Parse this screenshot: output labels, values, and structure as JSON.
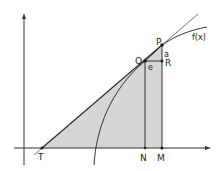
{
  "diagram": {
    "labels": {
      "T": "T",
      "N": "N",
      "M": "M",
      "Q": "Q",
      "P": "P",
      "R": "R",
      "a": "a",
      "e": "e",
      "function": "f(x)"
    },
    "colors": {
      "shade": "#d4d4d4",
      "axis": "#333333",
      "tangent": "#555555",
      "curve": "#333333"
    }
  }
}
